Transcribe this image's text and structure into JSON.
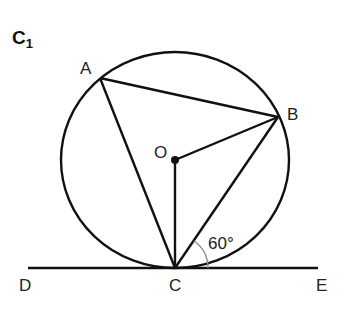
{
  "figure": {
    "title": "C",
    "title_subscript": "1",
    "points": {
      "A": {
        "label": "A",
        "x": 100,
        "y": 78
      },
      "B": {
        "label": "B",
        "x": 278,
        "y": 117
      },
      "O": {
        "label": "O",
        "x": 175,
        "y": 160
      },
      "C": {
        "label": "C",
        "x": 175,
        "y": 268
      },
      "D": {
        "label": "D",
        "x": 28,
        "y": 268
      },
      "E": {
        "label": "E",
        "x": 318,
        "y": 268
      }
    },
    "circle": {
      "center": "O",
      "rx": 114,
      "ry": 108
    },
    "segments": [
      "AB",
      "AC",
      "BC",
      "OB",
      "OC",
      "DE"
    ],
    "angle": {
      "vertex": "C",
      "between": [
        "CE",
        "CB"
      ],
      "label": "60°"
    },
    "colors": {
      "stroke": "#111111",
      "angle_arc": "#8a8a8a",
      "text": "#222222"
    }
  }
}
